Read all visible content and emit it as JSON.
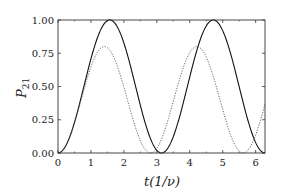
{
  "chart_data": {
    "type": "line",
    "title": "",
    "xlabel": "t(1/ν)",
    "ylabel": "P21",
    "xlim": [
      0,
      6.2832
    ],
    "ylim": [
      0,
      1.0
    ],
    "xticks": [
      "0",
      "1",
      "2",
      "3",
      "4",
      "5",
      "6"
    ],
    "yticks": [
      "0.00",
      "0.25",
      "0.50",
      "0.75",
      "1.00"
    ],
    "grid": false,
    "legend": null,
    "series": [
      {
        "name": "resonant",
        "style": "solid",
        "formula": "sin^2(t)",
        "x": [
          0,
          0.5,
          1.0,
          1.571,
          2.0,
          2.5,
          3.142,
          3.5,
          4.0,
          4.712,
          5.0,
          5.5,
          6.283
        ],
        "values": [
          0,
          0.23,
          0.71,
          1.0,
          0.83,
          0.36,
          0,
          0.12,
          0.57,
          1.0,
          0.92,
          0.5,
          0
        ]
      },
      {
        "name": "detuned",
        "style": "dotted",
        "formula": "0.8*sin^2(1.118*t)",
        "x": [
          0,
          0.5,
          1.0,
          1.405,
          2.0,
          2.5,
          2.81,
          3.5,
          4.215,
          5.0,
          5.62,
          6.283
        ],
        "values": [
          0,
          0.24,
          0.65,
          0.8,
          0.48,
          0.08,
          0,
          0.4,
          0.8,
          0.35,
          0,
          0.38
        ]
      }
    ],
    "plot_area": {
      "left": 58,
      "top": 20,
      "right": 265,
      "bottom": 153
    }
  }
}
